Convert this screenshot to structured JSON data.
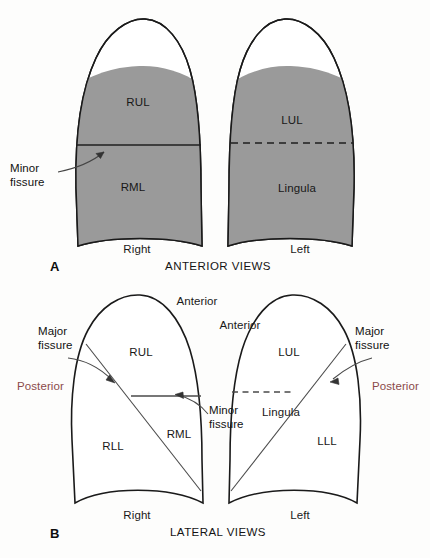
{
  "figure": {
    "background_color": "#fdfdfc",
    "lung_fill_color": "#9a9a9a",
    "outline_color": "#1a1a1a",
    "fissure_line_color": "#3a3a3a",
    "leader_line_color": "#4a4a4a",
    "posterior_text_color": "#8b4a4a"
  },
  "panels": [
    {
      "letter": "A",
      "caption": "ANTERIOR VIEWS",
      "lungs": [
        {
          "side_label": "Right",
          "lobes": [
            {
              "abbr": "RUL",
              "name": "right-upper-lobe"
            },
            {
              "abbr": "RML",
              "name": "right-middle-lobe"
            }
          ],
          "fissures": [
            {
              "label": "Minor fissure",
              "style": "solid"
            }
          ]
        },
        {
          "side_label": "Left",
          "lobes": [
            {
              "abbr": "LUL",
              "name": "left-upper-lobe"
            },
            {
              "abbr": "Lingula",
              "name": "lingula"
            }
          ],
          "fissures": [
            {
              "label": "",
              "style": "dashed"
            }
          ]
        }
      ],
      "callouts": [
        {
          "line1": "Minor",
          "line2": "fissure"
        }
      ]
    },
    {
      "letter": "B",
      "caption": "LATERAL VIEWS",
      "lungs": [
        {
          "side_label": "Right",
          "lobes": [
            {
              "abbr": "RUL",
              "name": "right-upper-lobe"
            },
            {
              "abbr": "RML",
              "name": "right-middle-lobe"
            },
            {
              "abbr": "RLL",
              "name": "right-lower-lobe"
            }
          ],
          "orientation": {
            "anterior": "Anterior",
            "posterior": "Posterior"
          },
          "fissures": [
            {
              "label": "Major fissure",
              "style": "solid"
            },
            {
              "label": "Minor fissure",
              "style": "solid"
            }
          ]
        },
        {
          "side_label": "Left",
          "lobes": [
            {
              "abbr": "LUL",
              "name": "left-upper-lobe"
            },
            {
              "abbr": "Lingula",
              "name": "lingula"
            },
            {
              "abbr": "LLL",
              "name": "left-lower-lobe"
            }
          ],
          "orientation": {
            "anterior": "Anterior",
            "posterior": "Posterior"
          },
          "fissures": [
            {
              "label": "Major fissure",
              "style": "solid"
            },
            {
              "label": "",
              "style": "dashed"
            }
          ]
        }
      ],
      "callouts": [
        {
          "line1": "Major",
          "line2": "fissure"
        },
        {
          "line1": "Minor",
          "line2": "fissure"
        },
        {
          "line1": "Major",
          "line2": "fissure"
        }
      ]
    }
  ],
  "labels": {
    "panel_a": {
      "letter": "A",
      "caption": "ANTERIOR VIEWS",
      "right_side": "Right",
      "left_side": "Left",
      "rul": "RUL",
      "rml": "RML",
      "lul": "LUL",
      "lingula": "Lingula",
      "minor_fissure_l1": "Minor",
      "minor_fissure_l2": "fissure"
    },
    "panel_b": {
      "letter": "B",
      "caption": "LATERAL VIEWS",
      "right_side": "Right",
      "left_side": "Left",
      "rul": "RUL",
      "rml": "RML",
      "rll": "RLL",
      "lul": "LUL",
      "lingula": "Lingula",
      "lll": "LLL",
      "anterior_right": "Anterior",
      "anterior_left": "Anterior",
      "posterior_right": "Posterior",
      "posterior_left": "Posterior",
      "major_fissure_right_l1": "Major",
      "major_fissure_right_l2": "fissure",
      "major_fissure_left_l1": "Major",
      "major_fissure_left_l2": "fissure",
      "minor_fissure_l1": "Minor",
      "minor_fissure_l2": "fissure"
    }
  }
}
